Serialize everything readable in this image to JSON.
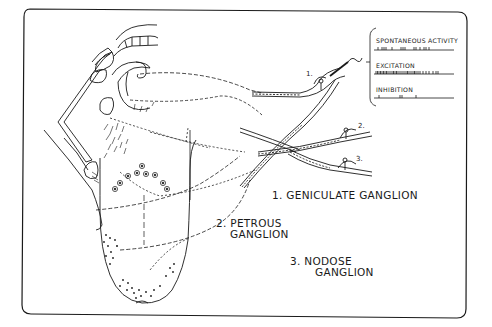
{
  "figure": {
    "type": "anatomical-diagram"
  },
  "inset": {
    "traces": [
      {
        "label": "SPONTANEOUS  ACTIVITY",
        "pattern": "sparse"
      },
      {
        "label": "EXCITATION",
        "pattern": "dense"
      },
      {
        "label": "INHIBITION",
        "pattern": "very-sparse"
      }
    ]
  },
  "ganglia": [
    {
      "number": "1.",
      "label_line1": "1. GENICULATE  GANGLION",
      "label_line2": ""
    },
    {
      "number": "2.",
      "label_line1": "2. PETROUS",
      "label_line2": "GANGLION"
    },
    {
      "number": "3.",
      "label_line1": "3. NODOSE",
      "label_line2": "GANGLION"
    }
  ],
  "colors": {
    "ink": "#1a1a1a",
    "background": "#ffffff"
  }
}
